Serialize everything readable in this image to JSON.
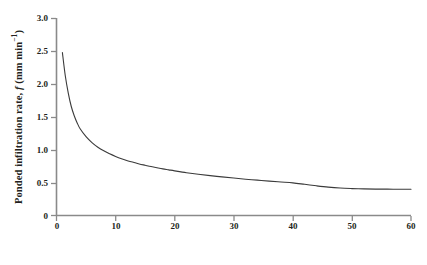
{
  "chart_data": {
    "type": "line",
    "title": "",
    "subtitle": "",
    "xlabel": "Time (minutes)",
    "ylabel": "Ponded infiltration rate, f (mm min-1)",
    "ylabel_parts": {
      "prefix": "Ponded infiltration rate, ",
      "symbol": "f",
      "units_open": " (mm min",
      "exponent": "−1",
      "units_close": ")"
    },
    "xlim": [
      0,
      60
    ],
    "ylim": [
      0,
      3.0
    ],
    "xticks": [
      "0",
      "10",
      "20",
      "30",
      "40",
      "50",
      "60"
    ],
    "xtick_values": [
      0,
      10,
      20,
      30,
      40,
      50,
      60
    ],
    "yticks": [
      "0",
      "0.5",
      "1.0",
      "1.5",
      "2.0",
      "2.5",
      "3.0"
    ],
    "ytick_values": [
      0,
      0.5,
      1.0,
      1.5,
      2.0,
      2.5,
      3.0
    ],
    "grid": false,
    "legend": null,
    "legend_position": "none",
    "annotations": [],
    "series": [
      {
        "name": "Ponded infiltration rate",
        "color": "#3b3b3b",
        "line_width": 1.1,
        "x": [
          1,
          1.5,
          2,
          2.5,
          3,
          3.5,
          4,
          5,
          6,
          7,
          8,
          9,
          10,
          11,
          12,
          13,
          14,
          15,
          16,
          17,
          18,
          19,
          20,
          22,
          24,
          26,
          28,
          30,
          32,
          34,
          36,
          38,
          40,
          42,
          44,
          46,
          48,
          50,
          52,
          54,
          56,
          58,
          60
        ],
        "values": [
          2.48,
          2.12,
          1.86,
          1.66,
          1.52,
          1.41,
          1.32,
          1.2,
          1.11,
          1.04,
          0.985,
          0.94,
          0.9,
          0.865,
          0.835,
          0.81,
          0.785,
          0.765,
          0.745,
          0.727,
          0.71,
          0.695,
          0.68,
          0.652,
          0.628,
          0.607,
          0.588,
          0.57,
          0.553,
          0.538,
          0.523,
          0.51,
          0.497,
          0.475,
          0.452,
          0.432,
          0.418,
          0.41,
          0.405,
          0.402,
          0.401,
          0.4,
          0.4
        ]
      }
    ],
    "asymptote": 0.4,
    "initial_value": 2.48,
    "axis_color": "#8a8a8a",
    "background": "#ffffff"
  }
}
